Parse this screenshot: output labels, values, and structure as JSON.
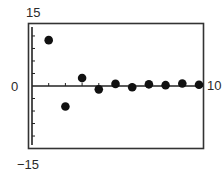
{
  "chart_data": {
    "type": "scatter",
    "title": "",
    "xlabel": "",
    "ylabel": "",
    "xlim": [
      0,
      10
    ],
    "ylim": [
      -15,
      15
    ],
    "grid": false,
    "legend": null,
    "labels": {
      "ymax": "15",
      "ymin": "−15",
      "xmin": "0",
      "xmax": "10"
    },
    "x_ticks": [
      1,
      2,
      3,
      4,
      5,
      6,
      7,
      8,
      9,
      10
    ],
    "y_ticks": [
      -12,
      -9,
      -6,
      -3,
      3,
      6,
      9,
      12
    ],
    "series": [
      {
        "name": "sequence",
        "x": [
          1,
          2,
          3,
          4,
          5,
          6,
          7,
          8,
          9,
          10
        ],
        "y": [
          11,
          -4.9,
          1.9,
          -0.8,
          0.5,
          -0.3,
          0.4,
          0.2,
          0.6,
          0.3
        ]
      }
    ],
    "colors": {
      "points": "#111111",
      "axes": "#222222",
      "frame": "#333333"
    }
  }
}
